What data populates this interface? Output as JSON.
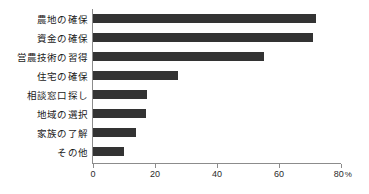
{
  "chart_data": {
    "type": "bar",
    "orientation": "horizontal",
    "title": "",
    "xlabel": "",
    "ylabel": "",
    "xlim": [
      0,
      80
    ],
    "xticks": [
      0,
      20,
      40,
      60,
      80
    ],
    "xtick_labels": [
      "0",
      "20",
      "40",
      "60",
      "80"
    ],
    "xunit": "%",
    "grid": false,
    "legend": false,
    "categories": [
      "農地の確保",
      "資金の確保",
      "営農技術の習得",
      "住宅の確保",
      "相談窓口探し",
      "地域の選択",
      "家族の了解",
      "その他"
    ],
    "values": [
      72,
      71,
      55,
      27.5,
      17.5,
      17,
      14,
      10
    ],
    "bar_color": "#333333",
    "axis_color": "#8c8c8c"
  }
}
